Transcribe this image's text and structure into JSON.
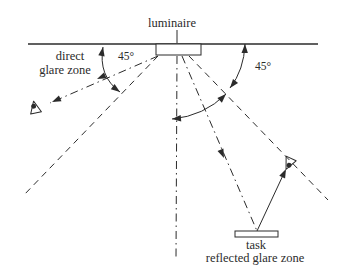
{
  "labels": {
    "luminaire": "luminaire",
    "direct_glare_line1": "direct",
    "direct_glare_line2": "glare zone",
    "angle_left": "45°",
    "angle_right": "45°",
    "task": "task",
    "reflected_glare_zone": "reflected glare zone"
  },
  "colors": {
    "ink": "#2b2b2b",
    "background": "#ffffff"
  },
  "icons": {
    "left_observer": "eye-icon",
    "right_observer": "eye-icon"
  }
}
